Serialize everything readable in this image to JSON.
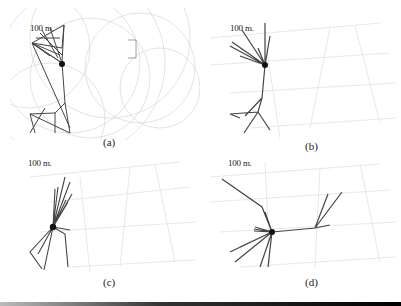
{
  "figure": {
    "panels": [
      {
        "id": "a",
        "caption": "(a)",
        "scale_label": "100 m."
      },
      {
        "id": "b",
        "caption": "(b)",
        "scale_label": "100 m."
      },
      {
        "id": "c",
        "caption": "(c)",
        "scale_label": "100 m."
      },
      {
        "id": "d",
        "caption": "(d)",
        "scale_label": "100 m."
      }
    ],
    "colors": {
      "network_edge": "#444444",
      "map_lines": "#d8d8d8",
      "range_circles": "#cccccc",
      "hub_node": "#111111"
    }
  }
}
